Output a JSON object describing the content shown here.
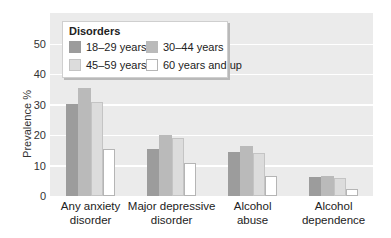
{
  "chart_data": {
    "type": "bar",
    "title": "",
    "xlabel": "",
    "ylabel": "Prevalence %",
    "ylim": [
      0,
      55
    ],
    "yticks": [
      0,
      10,
      20,
      30,
      40,
      50
    ],
    "grid": true,
    "legend_title": "Disorders",
    "legend_position": "upper-left, inside",
    "categories": [
      "Any anxiety disorder",
      "Major depressive disorder",
      "Alcohol abuse",
      "Alcohol dependence"
    ],
    "category_lines": [
      [
        "Any anxiety",
        "disorder"
      ],
      [
        "Major depressive",
        "disorder"
      ],
      [
        "Alcohol",
        "abuse"
      ],
      [
        "Alcohol",
        "dependence"
      ]
    ],
    "series": [
      {
        "name": "18–29 years",
        "color": "#9c9c9c",
        "values": [
          30.2,
          15.5,
          14.5,
          6.2
        ]
      },
      {
        "name": "30–44 years",
        "color": "#bababa",
        "values": [
          35.5,
          20.0,
          16.5,
          6.5
        ]
      },
      {
        "name": "45–59 years",
        "color": "#dcdcdc",
        "values": [
          31.0,
          19.0,
          14.2,
          6.0
        ]
      },
      {
        "name": "60 years and up",
        "color": "#ffffff",
        "values": [
          15.5,
          10.8,
          6.5,
          2.2
        ]
      }
    ]
  }
}
